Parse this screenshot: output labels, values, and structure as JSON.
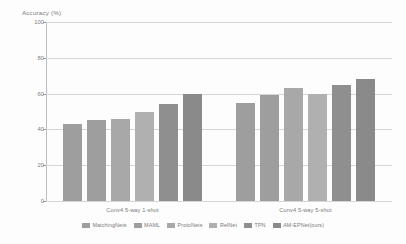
{
  "chart_data": {
    "type": "bar",
    "title": "",
    "xlabel": "",
    "ylabel": "Accuracy (%)",
    "ylim": [
      0,
      100
    ],
    "yticks": [
      0,
      20,
      40,
      60,
      80,
      100
    ],
    "grid": true,
    "legend_position": "bottom",
    "categories": [
      "Conv4 5-way 1-shot",
      "Conv4 5-way 5-shot"
    ],
    "series": [
      {
        "name": "MatchingNets",
        "color": "#9e9e9e",
        "values": [
          43,
          55
        ]
      },
      {
        "name": "MAML",
        "color": "#9e9e9e",
        "values": [
          45,
          59
        ]
      },
      {
        "name": "ProtoNets",
        "color": "#a8a8a8",
        "values": [
          46,
          63
        ]
      },
      {
        "name": "RelNet",
        "color": "#b0b0b0",
        "values": [
          50,
          60
        ]
      },
      {
        "name": "TPN",
        "color": "#8f8f8f",
        "values": [
          54,
          65
        ]
      },
      {
        "name": "AM-EPNet(ours)",
        "color": "#8a8a8a",
        "values": [
          60,
          68
        ]
      }
    ]
  },
  "axis": {
    "y_title": "Accuracy (%)"
  }
}
